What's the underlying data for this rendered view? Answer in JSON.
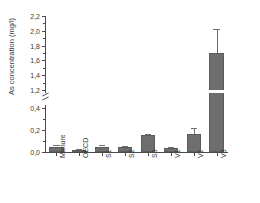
{
  "chart_data": {
    "type": "bar",
    "title": "",
    "subtitle": "",
    "xlabel": "",
    "ylabel": "As concentration (mg/l)",
    "categories": [
      "Manure",
      "OECD",
      "S1",
      "S2",
      "S3",
      "V1",
      "V2",
      "V3"
    ],
    "values": [
      0.05,
      0.02,
      0.05,
      0.05,
      0.152,
      0.035,
      0.165,
      1.7
    ],
    "errors": [
      0.012,
      0.005,
      0.012,
      0.008,
      0.01,
      0.008,
      0.055,
      0.33
    ],
    "series": [
      {
        "name": "As concentration",
        "values": [
          0.05,
          0.02,
          0.05,
          0.05,
          0.152,
          0.035,
          0.165,
          1.7
        ],
        "errors": [
          0.012,
          0.005,
          0.012,
          0.008,
          0.01,
          0.008,
          0.055,
          0.33
        ]
      }
    ],
    "ylim": [
      0.0,
      2.2
    ],
    "axis_break": {
      "present": true,
      "from": 0.4,
      "to": 1.2
    },
    "ytick_labels_lower": [
      "0,0",
      "0,2",
      "0,4"
    ],
    "ytick_values_lower": [
      0.0,
      0.2,
      0.4
    ],
    "ytick_labels_upper": [
      "1,2",
      "1,4",
      "1,6",
      "1,8",
      "2,0",
      "2,2"
    ],
    "ytick_values_upper": [
      1.2,
      1.4,
      1.6,
      1.8,
      2.0,
      2.2
    ],
    "grid": false,
    "legend": null,
    "legend_position": "none",
    "bar_color": "#6e6e6e",
    "axis_color": "#4a4a4a",
    "text_color": "#3a3a3a",
    "decimal_separator": "comma"
  }
}
